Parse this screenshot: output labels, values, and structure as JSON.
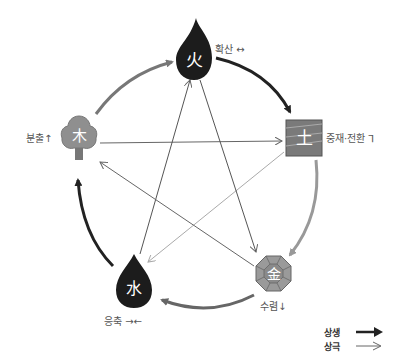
{
  "elements": [
    {
      "id": "fire",
      "char": "火",
      "label": "확산 ↔",
      "shape": "flame",
      "fill": "#1c1c1c"
    },
    {
      "id": "earth",
      "char": "土",
      "label": "중재·전환 ⅂",
      "shape": "square",
      "fill": "#7a7a7a"
    },
    {
      "id": "metal",
      "char": "金",
      "label": "수렴↓",
      "shape": "octagon",
      "fill": "#9a9a9a"
    },
    {
      "id": "water",
      "char": "水",
      "label": "응축 →←",
      "shape": "drop",
      "fill": "#1c1c1c"
    },
    {
      "id": "wood",
      "char": "木",
      "label": "분출↑",
      "shape": "tree",
      "fill": "#8f8f8f"
    }
  ],
  "generating_cycle": [
    {
      "from": "wood",
      "to": "fire",
      "color": "#777777"
    },
    {
      "from": "fire",
      "to": "earth",
      "color": "#222222"
    },
    {
      "from": "earth",
      "to": "metal",
      "color": "#999999"
    },
    {
      "from": "metal",
      "to": "water",
      "color": "#666666"
    },
    {
      "from": "water",
      "to": "wood",
      "color": "#222222"
    }
  ],
  "overcoming_cycle": [
    {
      "from": "wood",
      "to": "earth"
    },
    {
      "from": "earth",
      "to": "water"
    },
    {
      "from": "water",
      "to": "fire"
    },
    {
      "from": "fire",
      "to": "metal"
    },
    {
      "from": "metal",
      "to": "wood"
    }
  ],
  "legend": {
    "generating": "상생",
    "overcoming": "상극"
  }
}
